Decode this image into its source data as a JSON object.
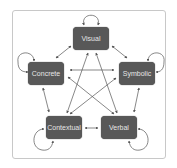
{
  "diagram": {
    "nodes": [
      {
        "id": "visual",
        "label": "Visual"
      },
      {
        "id": "concrete",
        "label": "Concrete"
      },
      {
        "id": "symbolic",
        "label": "Symbolic"
      },
      {
        "id": "contextual",
        "label": "Contextual"
      },
      {
        "id": "verbal",
        "label": "Verbal"
      }
    ],
    "edges": [
      {
        "from": "visual",
        "to": "visual",
        "type": "self-loop"
      },
      {
        "from": "concrete",
        "to": "concrete",
        "type": "self-loop"
      },
      {
        "from": "symbolic",
        "to": "symbolic",
        "type": "self-loop"
      },
      {
        "from": "contextual",
        "to": "contextual",
        "type": "self-loop"
      },
      {
        "from": "verbal",
        "to": "verbal",
        "type": "self-loop"
      },
      {
        "from": "visual",
        "to": "concrete",
        "type": "bidirectional"
      },
      {
        "from": "visual",
        "to": "symbolic",
        "type": "bidirectional"
      },
      {
        "from": "visual",
        "to": "contextual",
        "type": "bidirectional"
      },
      {
        "from": "visual",
        "to": "verbal",
        "type": "bidirectional"
      },
      {
        "from": "concrete",
        "to": "symbolic",
        "type": "bidirectional"
      },
      {
        "from": "concrete",
        "to": "contextual",
        "type": "bidirectional"
      },
      {
        "from": "concrete",
        "to": "verbal",
        "type": "bidirectional"
      },
      {
        "from": "symbolic",
        "to": "contextual",
        "type": "bidirectional"
      },
      {
        "from": "symbolic",
        "to": "verbal",
        "type": "bidirectional"
      },
      {
        "from": "contextual",
        "to": "verbal",
        "type": "bidirectional"
      }
    ],
    "colors": {
      "node_fill": "#585858",
      "node_text": "#e6e6e6",
      "edge": "#555555",
      "frame": "#c8c8c8"
    }
  }
}
